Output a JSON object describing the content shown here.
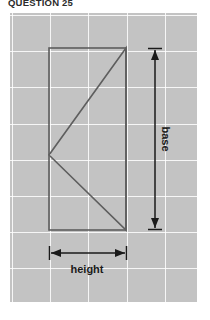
{
  "page": {
    "background_color": "#ffffff",
    "title": "QUESTION 25"
  },
  "diagram": {
    "panel": {
      "background_color": "#c3c3c3",
      "grid_line_color": "#ffffff",
      "grid_cell_width": 38,
      "grid_cell_height": 36,
      "x": 10,
      "y": 13,
      "width": 187,
      "height": 289
    },
    "shape_stroke_color": "#5e5e5e",
    "dimension_color": "#1a1a1a",
    "rectangle": {
      "left": 39,
      "top": 35,
      "right": 116,
      "bottom": 217
    },
    "triangle": {
      "vertices": [
        {
          "x": 116,
          "y": 35
        },
        {
          "x": 39,
          "y": 142
        },
        {
          "x": 116,
          "y": 217
        }
      ]
    },
    "dimensions": [
      {
        "name": "base",
        "label": "base",
        "orientation": "vertical",
        "rotation_deg": 90,
        "x": 145,
        "from_y": 35,
        "to_y": 217,
        "arrowheads": "both",
        "end_caps": "both"
      },
      {
        "name": "height",
        "label": "height",
        "orientation": "horizontal",
        "rotation_deg": 0,
        "y": 240,
        "from_x": 39,
        "to_x": 116,
        "arrowheads": "both",
        "end_caps": "both"
      }
    ]
  }
}
